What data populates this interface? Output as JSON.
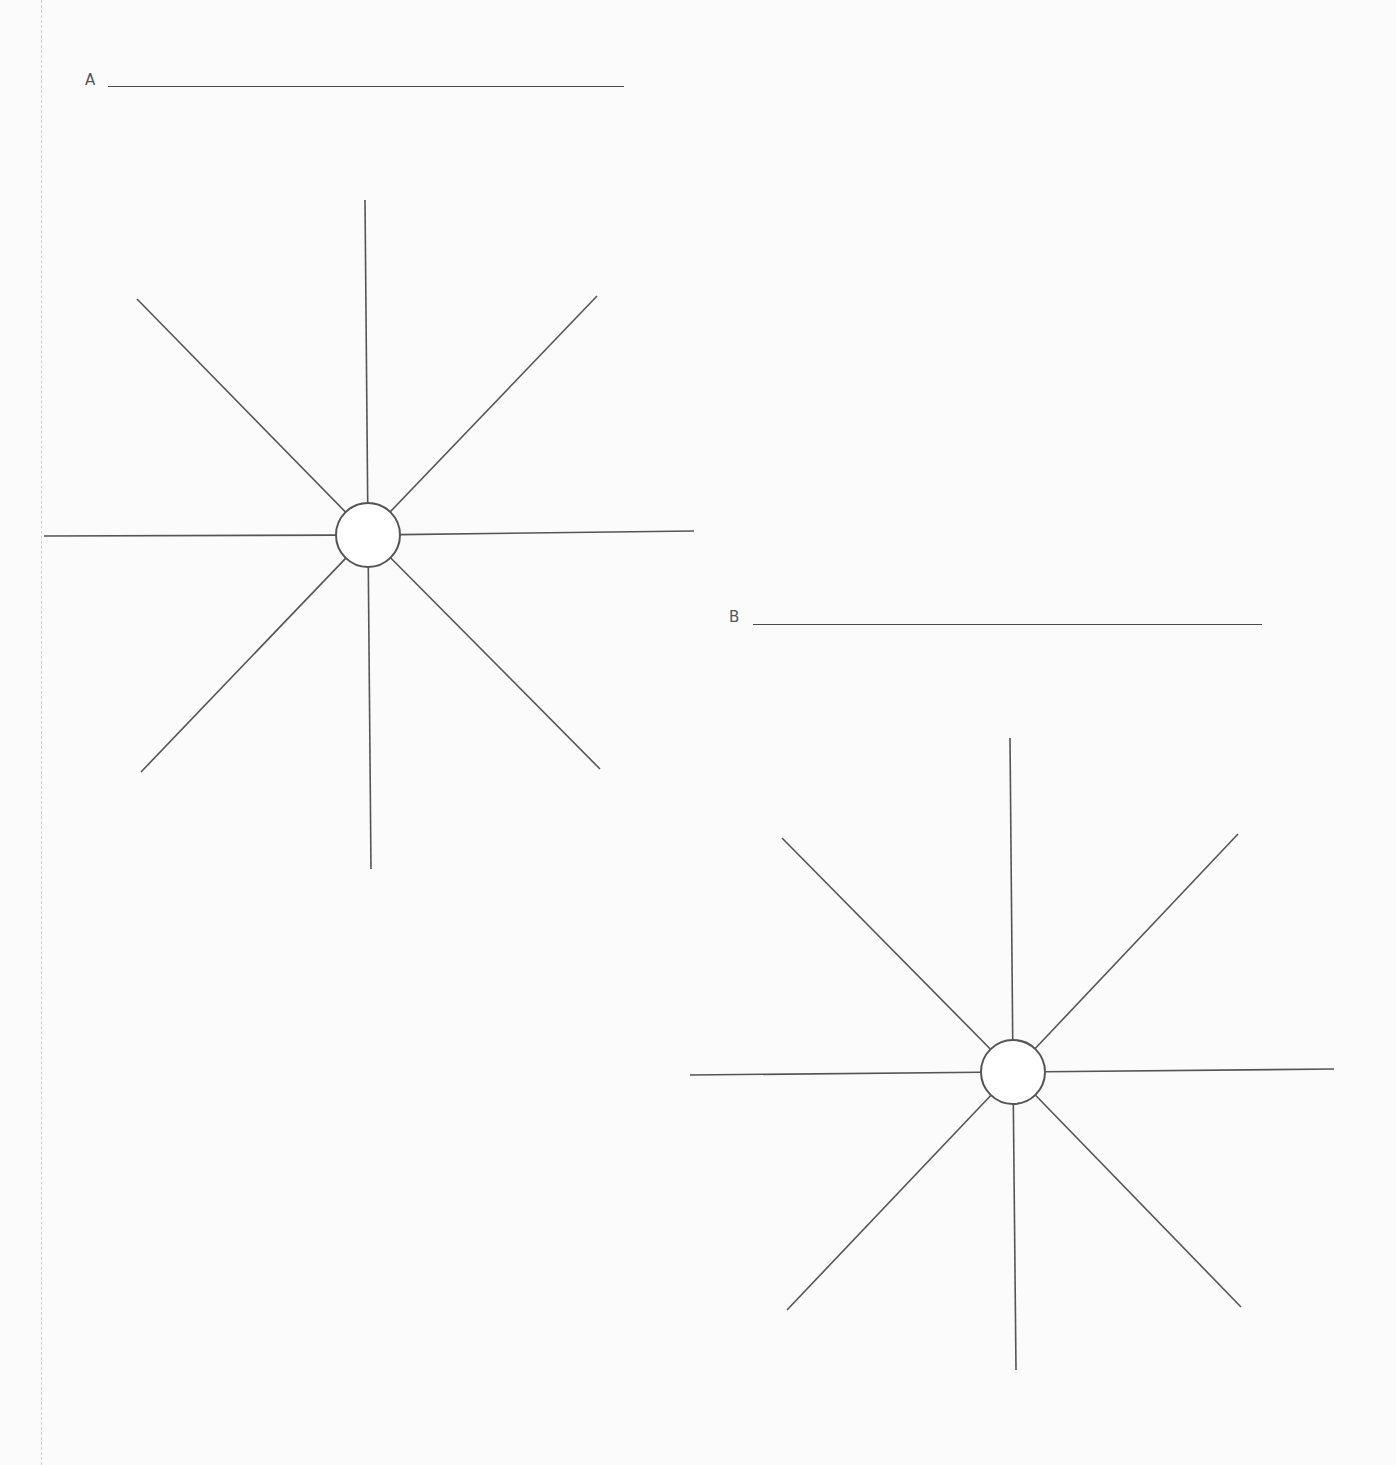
{
  "worksheet": {
    "diagrams": [
      {
        "label": "A",
        "label_pos": [
          85,
          71
        ],
        "answer_line": {
          "x": 108,
          "y": 86,
          "width": 516
        },
        "center": [
          368,
          535
        ],
        "radius": 32,
        "spokes": [
          [
            365,
            200
          ],
          [
            597,
            296
          ],
          [
            694,
            531
          ],
          [
            600,
            769
          ],
          [
            371,
            869
          ],
          [
            141,
            772
          ],
          [
            44,
            536
          ],
          [
            137,
            299
          ]
        ]
      },
      {
        "label": "B",
        "label_pos": [
          729,
          608
        ],
        "answer_line": {
          "x": 753,
          "y": 624,
          "width": 509
        },
        "center": [
          1013,
          1072
        ],
        "radius": 32,
        "spokes": [
          [
            1010,
            738
          ],
          [
            1238,
            834
          ],
          [
            1334,
            1069
          ],
          [
            1241,
            1307
          ],
          [
            1016,
            1370
          ],
          [
            787,
            1310
          ],
          [
            690,
            1075
          ],
          [
            782,
            838
          ]
        ]
      }
    ],
    "colors": {
      "line": "#555555",
      "background": "#fbfbfb"
    }
  }
}
